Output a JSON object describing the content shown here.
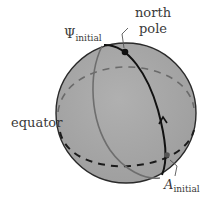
{
  "figure": {
    "labels": {
      "psi_symbol": "Ψ",
      "psi_subscript": "initial",
      "north_line1": "north",
      "north_line2": "pole",
      "equator": "equator",
      "a_symbol": "A",
      "a_subscript": "initial"
    },
    "colors": {
      "sphere_fill": "#a8a8a8",
      "sphere_outline": "#2a2a2a",
      "meridian_front": "#111111",
      "meridian_back": "#6e6e6e",
      "equator_front": "#1a1a1a",
      "equator_back": "#6a6a6a",
      "label_text": "#3a3a3a"
    }
  }
}
